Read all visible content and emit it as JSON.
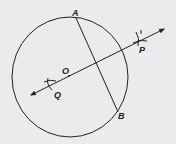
{
  "diagram": {
    "type": "geometry-construction",
    "colors": {
      "background": "#ebebeb",
      "ink": "#222222"
    },
    "circle": {
      "center_label": "O",
      "cx": 70,
      "cy": 77,
      "rx": 58,
      "ry": 60
    },
    "chord": {
      "from": "A",
      "to": "B"
    },
    "bisector_line": {
      "through": [
        "Q",
        "O",
        "P"
      ],
      "arrows": "both"
    },
    "points": [
      {
        "id": "A",
        "label": "A",
        "x": 76,
        "y": 18
      },
      {
        "id": "B",
        "label": "B",
        "x": 118,
        "y": 112
      },
      {
        "id": "O",
        "label": "O",
        "x": 68,
        "y": 75
      },
      {
        "id": "P",
        "label": "P",
        "x": 141,
        "y": 40
      },
      {
        "id": "Q",
        "label": "Q",
        "x": 51,
        "y": 84
      }
    ],
    "labels": {
      "A": "A",
      "B": "B",
      "O": "O",
      "P": "P",
      "Q": "Q"
    }
  }
}
